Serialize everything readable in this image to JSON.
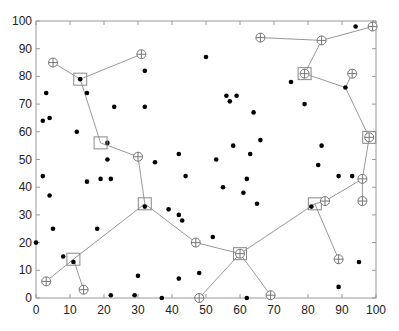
{
  "chart_data": {
    "type": "scatter",
    "title": "",
    "xlabel": "",
    "ylabel": "",
    "xlim": [
      0,
      100
    ],
    "ylim": [
      0,
      100
    ],
    "grid": false,
    "x_ticks": [
      0,
      10,
      20,
      30,
      40,
      50,
      60,
      70,
      80,
      90,
      100
    ],
    "y_ticks": [
      0,
      10,
      20,
      30,
      40,
      50,
      60,
      70,
      80,
      90,
      100
    ],
    "series": [
      {
        "name": "points",
        "marker": "filled-dot",
        "color": "#000000",
        "points": [
          [
            0,
            20
          ],
          [
            2,
            44
          ],
          [
            4,
            37
          ],
          [
            3,
            74
          ],
          [
            2,
            64
          ],
          [
            4,
            65
          ],
          [
            5,
            25
          ],
          [
            8,
            15
          ],
          [
            11,
            13
          ],
          [
            12,
            60
          ],
          [
            13,
            79
          ],
          [
            15,
            74
          ],
          [
            15,
            42
          ],
          [
            18,
            25
          ],
          [
            19,
            43
          ],
          [
            21,
            56
          ],
          [
            21,
            50
          ],
          [
            22,
            43
          ],
          [
            22,
            1
          ],
          [
            23,
            69
          ],
          [
            29,
            1
          ],
          [
            30,
            8
          ],
          [
            32,
            82
          ],
          [
            32,
            69
          ],
          [
            32,
            33
          ],
          [
            35,
            49
          ],
          [
            37,
            0
          ],
          [
            39,
            32
          ],
          [
            42,
            30
          ],
          [
            42,
            7
          ],
          [
            43,
            28
          ],
          [
            44,
            44
          ],
          [
            42,
            52
          ],
          [
            48,
            9
          ],
          [
            52,
            22
          ],
          [
            50,
            87
          ],
          [
            53,
            50
          ],
          [
            55,
            40
          ],
          [
            56,
            73
          ],
          [
            57,
            71
          ],
          [
            58,
            55
          ],
          [
            59,
            73
          ],
          [
            61,
            38
          ],
          [
            62,
            43
          ],
          [
            62,
            0
          ],
          [
            63,
            52
          ],
          [
            64,
            67
          ],
          [
            65,
            34
          ],
          [
            66,
            57
          ],
          [
            75,
            78
          ],
          [
            79,
            70
          ],
          [
            81,
            33
          ],
          [
            83,
            48
          ],
          [
            84,
            55
          ],
          [
            89,
            44
          ],
          [
            89,
            4
          ],
          [
            91,
            76
          ],
          [
            93,
            44
          ],
          [
            94,
            98
          ],
          [
            95,
            13
          ]
        ]
      },
      {
        "name": "centers",
        "marker": "square",
        "color": "#888888",
        "points": [
          [
            13,
            79
          ],
          [
            19,
            56
          ],
          [
            32,
            34
          ],
          [
            11,
            14
          ],
          [
            60,
            16
          ],
          [
            82,
            34
          ],
          [
            79,
            81
          ],
          [
            98,
            58
          ]
        ]
      },
      {
        "name": "nodes",
        "marker": "circle-plus",
        "color": "#888888",
        "points": [
          [
            5,
            85
          ],
          [
            31,
            88
          ],
          [
            30,
            51
          ],
          [
            3,
            6
          ],
          [
            14,
            3
          ],
          [
            47,
            20
          ],
          [
            48,
            0
          ],
          [
            60,
            16
          ],
          [
            69,
            1
          ],
          [
            85,
            35
          ],
          [
            89,
            14
          ],
          [
            96,
            43
          ],
          [
            96,
            35
          ],
          [
            98,
            58
          ],
          [
            79,
            81
          ],
          [
            93,
            81
          ],
          [
            84,
            93
          ],
          [
            66,
            94
          ],
          [
            99,
            98
          ]
        ]
      }
    ],
    "links": [
      [
        [
          5,
          85
        ],
        [
          13,
          79
        ]
      ],
      [
        [
          31,
          88
        ],
        [
          13,
          79
        ]
      ],
      [
        [
          13,
          79
        ],
        [
          19,
          56
        ]
      ],
      [
        [
          19,
          56
        ],
        [
          30,
          51
        ]
      ],
      [
        [
          30,
          51
        ],
        [
          32,
          34
        ]
      ],
      [
        [
          32,
          34
        ],
        [
          11,
          14
        ]
      ],
      [
        [
          11,
          14
        ],
        [
          3,
          6
        ]
      ],
      [
        [
          11,
          14
        ],
        [
          14,
          3
        ]
      ],
      [
        [
          32,
          34
        ],
        [
          47,
          20
        ]
      ],
      [
        [
          47,
          20
        ],
        [
          60,
          16
        ]
      ],
      [
        [
          60,
          16
        ],
        [
          48,
          0
        ]
      ],
      [
        [
          60,
          16
        ],
        [
          69,
          1
        ]
      ],
      [
        [
          60,
          16
        ],
        [
          82,
          34
        ]
      ],
      [
        [
          82,
          34
        ],
        [
          85,
          35
        ]
      ],
      [
        [
          82,
          34
        ],
        [
          89,
          14
        ]
      ],
      [
        [
          85,
          35
        ],
        [
          96,
          43
        ]
      ],
      [
        [
          96,
          43
        ],
        [
          96,
          35
        ]
      ],
      [
        [
          96,
          43
        ],
        [
          98,
          58
        ]
      ],
      [
        [
          98,
          58
        ],
        [
          91,
          76
        ]
      ],
      [
        [
          91,
          76
        ],
        [
          93,
          81
        ]
      ],
      [
        [
          91,
          76
        ],
        [
          79,
          81
        ]
      ],
      [
        [
          79,
          81
        ],
        [
          84,
          93
        ]
      ],
      [
        [
          84,
          93
        ],
        [
          66,
          94
        ]
      ],
      [
        [
          84,
          93
        ],
        [
          99,
          98
        ]
      ]
    ]
  }
}
